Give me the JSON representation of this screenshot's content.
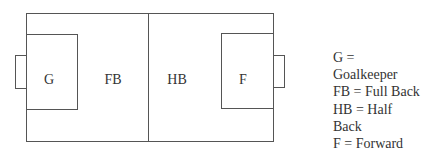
{
  "diagram": {
    "positions": [
      {
        "id": "g",
        "label": "G"
      },
      {
        "id": "fb",
        "label": "FB"
      },
      {
        "id": "hb",
        "label": "HB"
      },
      {
        "id": "f",
        "label": "F"
      }
    ]
  },
  "legend": {
    "lines": [
      "G =",
      "Goalkeeper",
      "FB = Full Back",
      "HB = Half",
      "Back",
      "F = Forward"
    ]
  },
  "colors": {
    "line": "#555555",
    "text": "#333333",
    "background": "#ffffff"
  }
}
